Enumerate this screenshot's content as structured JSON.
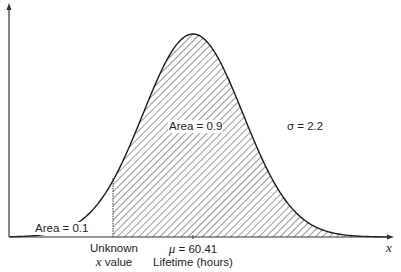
{
  "diagram": {
    "type": "normal-distribution-curve",
    "mean_label_symbol": "μ",
    "mean_label_value": " = 60.41",
    "x_axis_title": "Lifetime (hours)",
    "x_axis_symbol": "x",
    "unknown_label_line1": "Unknown",
    "unknown_label_line2_var": "x",
    "unknown_label_line2_rest": " value",
    "area_left_label": "Area = 0.1",
    "area_right_label": "Area = 0.9",
    "sigma_symbol": "σ",
    "sigma_value": " = 2.2",
    "colors": {
      "curve": "#1a1a1a",
      "hatch": "#444444",
      "axis": "#333333",
      "background": "#ffffff"
    }
  },
  "chart_data": {
    "type": "area",
    "title": "",
    "xlabel": "Lifetime (hours)",
    "ylabel": "",
    "distribution": "normal",
    "mean": 60.41,
    "sigma": 2.2,
    "shaded_region": "x > unknown x value",
    "areas": [
      {
        "label": "Area = 0.1",
        "region": "left of unknown x value",
        "value": 0.1
      },
      {
        "label": "Area = 0.9",
        "region": "right of unknown x value",
        "value": 0.9
      }
    ],
    "annotations": [
      "Unknown x value",
      "μ = 60.41",
      "σ = 2.2",
      "x"
    ]
  }
}
